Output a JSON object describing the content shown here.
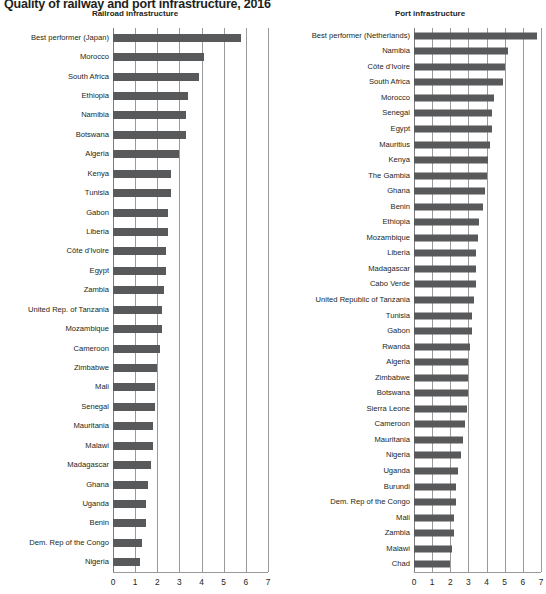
{
  "figure": {
    "title": "Quality of railway and port infrastructure, 2016",
    "axis_max": 7,
    "bar_color": "#58595b",
    "grid_color": "#9a9a9a"
  },
  "chart_data": [
    {
      "type": "bar",
      "orientation": "horizontal",
      "title": "Railroad infrastructure",
      "xlabel": "",
      "ylabel": "",
      "xlim": [
        0,
        7
      ],
      "grid": true,
      "legend": "none",
      "ticks": [
        "0",
        "1",
        "2",
        "3",
        "4",
        "5",
        "6",
        "7"
      ],
      "categories": [
        "Best performer (Japan)",
        "Morocco",
        "South Africa",
        "Ethiopia",
        "Namibia",
        "Botswana",
        "Algeria",
        "Kenya",
        "Tunisia",
        "Gabon",
        "Liberia",
        "Côte d'Ivoire",
        "Egypt",
        "Zambia",
        "United Rep. of Tanzania",
        "Mozambique",
        "Cameroon",
        "Zimbabwe",
        "Mali",
        "Senegal",
        "Mauritania",
        "Malawi",
        "Madagascar",
        "Ghana",
        "Uganda",
        "Benin",
        "Dem. Rep of the Congo",
        "Nigeria"
      ],
      "values": [
        5.8,
        4.1,
        3.9,
        3.4,
        3.3,
        3.3,
        3.0,
        2.6,
        2.6,
        2.5,
        2.5,
        2.4,
        2.4,
        2.3,
        2.2,
        2.2,
        2.1,
        2.0,
        1.9,
        1.9,
        1.8,
        1.8,
        1.7,
        1.6,
        1.5,
        1.5,
        1.3,
        1.2
      ]
    },
    {
      "type": "bar",
      "orientation": "horizontal",
      "title": "Port infrastructure",
      "xlabel": "",
      "ylabel": "",
      "xlim": [
        0,
        7
      ],
      "grid": true,
      "legend": "none",
      "ticks": [
        "0",
        "1",
        "2",
        "3",
        "4",
        "5",
        "6",
        "7"
      ],
      "categories": [
        "Best performer (Netherlands)",
        "Namibia",
        "Côte d'Ivoire",
        "South Africa",
        "Morocco",
        "Senegal",
        "Egypt",
        "Mauritius",
        "Kenya",
        "The Gambia",
        "Ghana",
        "Benin",
        "Ethiopia",
        "Mozambique",
        "Liberia",
        "Madagascar",
        "Cabo Verde",
        "United Republic of Tanzania",
        "Tunisia",
        "Gabon",
        "Rwanda",
        "Algeria",
        "Zimbabwe",
        "Botswana",
        "Sierra Leone",
        "Cameroon",
        "Mauritania",
        "Nigeria",
        "Uganda",
        "Burundi",
        "Dem. Rep of the Congo",
        "Mali",
        "Zambia",
        "Malawi",
        "Chad"
      ],
      "values": [
        6.8,
        5.2,
        5.0,
        4.9,
        4.4,
        4.3,
        4.3,
        4.2,
        4.1,
        4.0,
        3.9,
        3.8,
        3.6,
        3.5,
        3.4,
        3.4,
        3.4,
        3.3,
        3.2,
        3.2,
        3.1,
        3.0,
        3.0,
        3.0,
        2.9,
        2.8,
        2.7,
        2.6,
        2.4,
        2.3,
        2.3,
        2.2,
        2.2,
        2.1,
        2.0
      ]
    }
  ]
}
